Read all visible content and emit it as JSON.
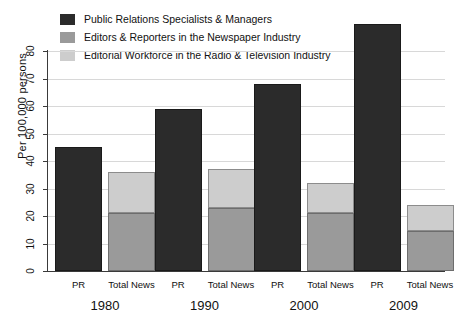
{
  "chart_data": {
    "type": "bar",
    "title": "",
    "subtitle": "",
    "xlabel": "",
    "ylabel": "Per 100,000 persons",
    "ylim": [
      0,
      80
    ],
    "yticks": [
      0,
      10,
      20,
      30,
      40,
      50,
      60,
      70,
      80
    ],
    "grid": true,
    "legend_position": "top-left",
    "stacked": true,
    "categories": [
      "1980",
      "1990",
      "2000",
      "2009"
    ],
    "subcategories": [
      "PR",
      "Total News"
    ],
    "series": [
      {
        "name": "Public Relations Specialists & Managers",
        "color": "#2b2b2b",
        "bar_group": "PR",
        "values": [
          45,
          59,
          68,
          90
        ]
      },
      {
        "name": "Editors & Reporters in the Newspaper Industry",
        "color": "#9a9a9a",
        "bar_group": "Total News",
        "values": [
          21,
          23,
          21,
          14.5
        ]
      },
      {
        "name": "Editorial Workforce in the Radio & Television Industry",
        "color": "#cdcdcd",
        "bar_group": "Total News",
        "values": [
          15,
          14,
          11,
          9.5
        ]
      }
    ],
    "total_news_totals": [
      36,
      37,
      32,
      24
    ]
  },
  "legend": {
    "items": [
      {
        "label": "Public Relations Specialists & Managers",
        "color": "#2b2b2b"
      },
      {
        "label": "Editors & Reporters in the Newspaper Industry",
        "color": "#9a9a9a"
      },
      {
        "label": "Editorial Workforce in the Radio & Television Industry",
        "color": "#cdcdcd"
      }
    ]
  },
  "axes": {
    "y_title": "Per 100,000 persons",
    "y_tick_labels": [
      "0",
      "10",
      "20",
      "30",
      "40",
      "50",
      "60",
      "70",
      "80"
    ],
    "x_sub_labels": [
      "PR",
      "Total News",
      "PR",
      "Total News",
      "PR",
      "Total News",
      "PR",
      "Total News"
    ],
    "x_group_labels": [
      "1980",
      "1990",
      "2000",
      "2009"
    ]
  }
}
